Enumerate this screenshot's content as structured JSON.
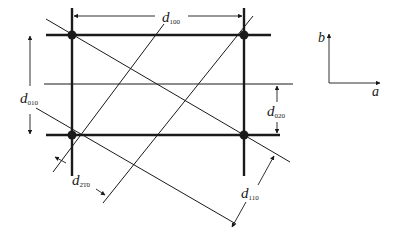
{
  "diagram": {
    "type": "2D lattice with interplanar spacings",
    "colors": {
      "line": "#1a1a1a",
      "background": "#ffffff"
    },
    "lattice_points": [
      {
        "id": "top-left",
        "x": 72,
        "y": 35
      },
      {
        "id": "top-right",
        "x": 244,
        "y": 35
      },
      {
        "id": "bottom-left",
        "x": 72,
        "y": 135
      },
      {
        "id": "bottom-right",
        "x": 244,
        "y": 135
      }
    ],
    "labels": {
      "d100": {
        "main": "d",
        "sub": "100"
      },
      "d010": {
        "main": "d",
        "sub": "010"
      },
      "d020": {
        "main": "d",
        "sub": "020"
      },
      "d2bar10": {
        "main": "d",
        "sub": "2̅1̅0",
        "sub_display": "2̄1̄0"
      },
      "d110": {
        "main": "d",
        "sub": "110"
      }
    },
    "axes": {
      "a_label": "a",
      "b_label": "b"
    }
  }
}
